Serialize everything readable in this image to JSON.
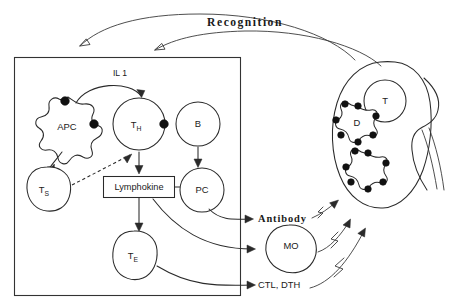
{
  "figure": {
    "title": "Recognition",
    "compartment_label": "",
    "cells": [
      {
        "id": "apc",
        "label": "APC",
        "sub": "",
        "shape": "star-blob",
        "cx": 68,
        "cy": 124
      },
      {
        "id": "th",
        "label": "T",
        "sub": "H",
        "shape": "circle",
        "cx": 139,
        "cy": 124
      },
      {
        "id": "b",
        "label": "B",
        "sub": "",
        "shape": "circle",
        "cx": 198,
        "cy": 124
      },
      {
        "id": "ts",
        "label": "T",
        "sub": "S",
        "shape": "blob",
        "cx": 47,
        "cy": 189
      },
      {
        "id": "pc",
        "label": "PC",
        "sub": "",
        "shape": "circle",
        "cx": 199,
        "cy": 190
      },
      {
        "id": "te",
        "label": "T",
        "sub": "E",
        "shape": "blob",
        "cx": 135,
        "cy": 258
      },
      {
        "id": "mo",
        "label": "MO",
        "sub": "",
        "shape": "blob",
        "cx": 289,
        "cy": 245
      },
      {
        "id": "target-t",
        "label": "T",
        "sub": "",
        "shape": "circle",
        "cx": 385,
        "cy": 101
      },
      {
        "id": "dendritic-d",
        "label": "D",
        "sub": "",
        "shape": "star-dotted",
        "cx": 358,
        "cy": 124
      },
      {
        "id": "dendritic-2",
        "label": "",
        "sub": "",
        "shape": "star-dotted",
        "cx": 368,
        "cy": 171
      }
    ],
    "mediators": [
      {
        "id": "il1",
        "label": "IL 1"
      },
      {
        "id": "lymphokine",
        "label": "Lymphokine"
      }
    ],
    "effectors": [
      {
        "id": "antibody",
        "label": "Antibody",
        "style": "bold"
      },
      {
        "id": "ctl-dth",
        "label": "CTL, DTH",
        "style": "plain"
      }
    ],
    "colors": {
      "ink": "#2a2a2a",
      "fill": "#ffffff",
      "dot": "#111111"
    }
  }
}
